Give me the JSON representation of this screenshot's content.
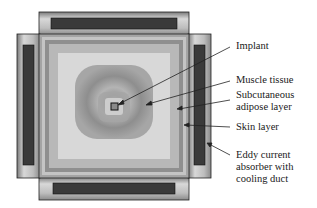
{
  "diagram": {
    "type": "cross-section simulation figure",
    "labels": {
      "implant": "Implant",
      "muscle": "Muscle tissue",
      "subcutaneous_line1": "Subcutaneous",
      "subcutaneous_line2": "adipose layer",
      "skin": "Skin layer",
      "eddy_line1": "Eddy current",
      "eddy_line2": "absorber with",
      "eddy_line3": "cooling duct"
    },
    "colors": {
      "outline": "#222222",
      "absorber_bar": "#3a3a3a",
      "absorber_frame": "#a8a8a8",
      "skin": "#9a9a9a",
      "adipose": "#d6d6d6",
      "muscle_outer": "#b0b0b0",
      "muscle_inner": "#8c8c8c",
      "center": "#cfcfcf"
    }
  }
}
